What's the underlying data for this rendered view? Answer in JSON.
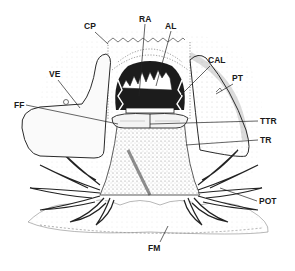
{
  "figure": {
    "type": "anatomical-line-drawing",
    "background": "#ffffff",
    "ink": "#1a1a1a"
  },
  "labels": [
    {
      "id": "RA",
      "text": "RA",
      "x": 139,
      "y": 22
    },
    {
      "id": "CP",
      "text": "CP",
      "x": 88,
      "y": 29
    },
    {
      "id": "AL",
      "text": "AL",
      "x": 169,
      "y": 29
    },
    {
      "id": "CAL",
      "text": "CAL",
      "x": 208,
      "y": 64
    },
    {
      "id": "PT",
      "text": "PT",
      "x": 234,
      "y": 82
    },
    {
      "id": "VE",
      "text": "VE",
      "x": 50,
      "y": 76
    },
    {
      "id": "FF",
      "text": "FF",
      "x": 16,
      "y": 106
    },
    {
      "id": "TTR",
      "text": "TTR",
      "x": 260,
      "y": 124
    },
    {
      "id": "TR",
      "text": "TR",
      "x": 260,
      "y": 143
    },
    {
      "id": "POT",
      "text": "POT",
      "x": 260,
      "y": 204
    },
    {
      "id": "FM",
      "text": "FM",
      "x": 156,
      "y": 250
    }
  ]
}
